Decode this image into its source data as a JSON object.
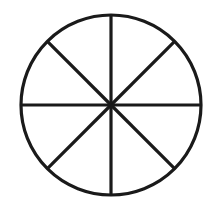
{
  "document": {
    "title": "Circle Divided Into Eighths",
    "description": "Line drawing of a circle partitioned by eight radial spokes into eight equal sectors",
    "background_color": "#ffffff"
  },
  "chart_data": {
    "type": "pie",
    "title": "",
    "subtitle": "",
    "xlabel": "",
    "ylabel": "",
    "legend": [],
    "annotations": [],
    "grid": false,
    "labels_visible": false,
    "slice_count": 8,
    "categories": [
      "1",
      "2",
      "3",
      "4",
      "5",
      "6",
      "7",
      "8"
    ],
    "values": [
      12.5,
      12.5,
      12.5,
      12.5,
      12.5,
      12.5,
      12.5,
      12.5
    ],
    "fraction_each": "1/8",
    "degrees_each": 45,
    "fill_colors": [
      "#ffffff",
      "#ffffff",
      "#ffffff",
      "#ffffff",
      "#ffffff",
      "#ffffff",
      "#ffffff",
      "#ffffff"
    ],
    "stroke_color": "#1a1a1a"
  },
  "geometry": {
    "center_x": 111,
    "center_y": 105,
    "radius": 90,
    "stroke_color": "#1a1a1a",
    "stroke_width": 3.2,
    "spoke_count": 8,
    "spoke_angles_deg": [
      0,
      45,
      90,
      135,
      180,
      225,
      270,
      315
    ],
    "spokes": [
      {
        "name": "spoke-east",
        "angle_deg": 0,
        "x2": 201,
        "y2": 105
      },
      {
        "name": "spoke-northeast",
        "angle_deg": 45,
        "x2": 174.6,
        "y2": 41.4
      },
      {
        "name": "spoke-north",
        "angle_deg": 90,
        "x2": 111,
        "y2": 15
      },
      {
        "name": "spoke-northwest",
        "angle_deg": 135,
        "x2": 47.4,
        "y2": 41.4
      },
      {
        "name": "spoke-west",
        "angle_deg": 180,
        "x2": 21,
        "y2": 105
      },
      {
        "name": "spoke-southwest",
        "angle_deg": 225,
        "x2": 47.4,
        "y2": 168.6
      },
      {
        "name": "spoke-south",
        "angle_deg": 270,
        "x2": 111,
        "y2": 195
      },
      {
        "name": "spoke-southeast",
        "angle_deg": 315,
        "x2": 174.6,
        "y2": 168.6
      }
    ]
  }
}
